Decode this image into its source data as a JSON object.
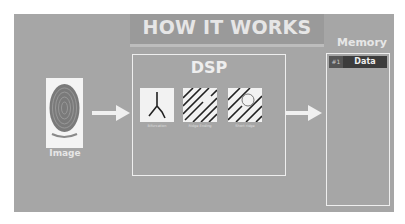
{
  "title": "HOW IT WORKS",
  "input": {
    "label": "Image",
    "icon": "fingerprint-icon"
  },
  "dsp": {
    "label": "DSP",
    "features": [
      {
        "label": "Bifurcation",
        "icon": "bifurcation-icon"
      },
      {
        "label": "Ridge Ending",
        "icon": "ridge-ending-icon"
      },
      {
        "label": "Short ridge",
        "icon": "short-ridge-icon"
      }
    ]
  },
  "memory": {
    "label": "Memory",
    "rows": [
      {
        "index": "#1",
        "value": "Data"
      }
    ]
  },
  "colors": {
    "panel": "#a6a6a6",
    "text": "#e6e6e6",
    "memory_row": "#3c3c3c"
  }
}
